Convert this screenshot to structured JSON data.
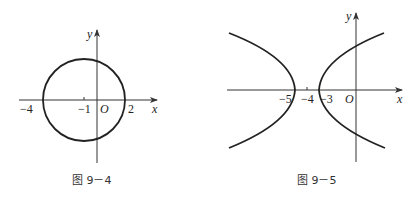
{
  "figures": [
    {
      "id": "fig-9-4",
      "caption": "图 9－4",
      "type": "circle",
      "axis_labels": {
        "x": "x",
        "y": "y",
        "origin": "O"
      },
      "ticks": [
        "−4",
        "−1",
        "2"
      ],
      "center": [
        -1,
        0
      ],
      "radius": 3
    },
    {
      "id": "fig-9-5",
      "caption": "图 9－5",
      "type": "hyperbola",
      "axis_labels": {
        "x": "x",
        "y": "y",
        "origin": "O"
      },
      "ticks": [
        "−5",
        "−4",
        "−3"
      ],
      "center": [
        -4,
        0
      ],
      "vertices": [
        [
          -5,
          0
        ],
        [
          -3,
          0
        ]
      ]
    }
  ],
  "colors": {
    "stroke": "#222222",
    "background": "#ffffff"
  }
}
